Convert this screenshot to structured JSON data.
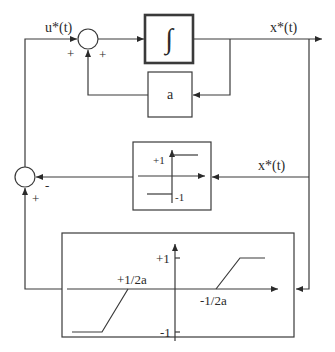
{
  "diagram": {
    "signals": {
      "input_label": "u*(t)",
      "output_label": "x*(t)",
      "feedback_label": "x*(t)"
    },
    "summing_junction_top": {
      "sign_left": "+",
      "sign_bottom": "+"
    },
    "summing_junction_left": {
      "sign_right": "-",
      "sign_bottom": "+"
    },
    "integrator_block": {
      "symbol": "∫"
    },
    "gain_block": {
      "label": "a"
    },
    "relay_block": {
      "plus_label": "+1",
      "minus_label": "-1"
    },
    "saturation_block": {
      "plus_label": "+1",
      "minus_label": "-1",
      "left_break_label": "+1/2a",
      "right_break_label": "-1/2a"
    },
    "colors": {
      "line": "#3a3a3a",
      "background": "#ffffff"
    }
  }
}
